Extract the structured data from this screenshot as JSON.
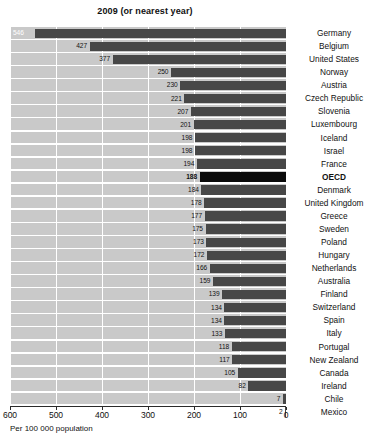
{
  "chart_data": {
    "type": "bar",
    "orientation": "horizontal",
    "title": "2009 (or nearest year)",
    "xlabel": "Per 100 000 population",
    "ylabel": "",
    "xlim": [
      600,
      0
    ],
    "x_reversed": true,
    "grid": true,
    "legend": null,
    "tick_labels": [
      "600",
      "500",
      "400",
      "300",
      "200",
      "100",
      "0"
    ],
    "tick_values": [
      600,
      500,
      400,
      300,
      200,
      100,
      0
    ],
    "highlight_category": "OECD",
    "categories": [
      "Germany",
      "Belgium",
      "United States",
      "Norway",
      "Austria",
      "Czech Republic",
      "Slovenia",
      "Luxembourg",
      "Iceland",
      "Israel",
      "France",
      "OECD",
      "Denmark",
      "United Kingdom",
      "Greece",
      "Sweden",
      "Poland",
      "Hungary",
      "Netherlands",
      "Australia",
      "Finland",
      "Switzerland",
      "Spain",
      "Italy",
      "Portugal",
      "New Zealand",
      "Canada",
      "Ireland",
      "Chile",
      "Mexico"
    ],
    "values": [
      546,
      427,
      377,
      250,
      230,
      221,
      207,
      201,
      198,
      198,
      194,
      188,
      184,
      178,
      177,
      175,
      173,
      172,
      166,
      159,
      139,
      134,
      134,
      133,
      118,
      117,
      105,
      82,
      7,
      2
    ],
    "colors": {
      "bar": "#474747",
      "bar_highlight": "#0a0a0a",
      "plot_background": "#c9c9c9",
      "gridline": "#ffffff",
      "text": "#111111",
      "value_inside": "#ffffff"
    }
  }
}
